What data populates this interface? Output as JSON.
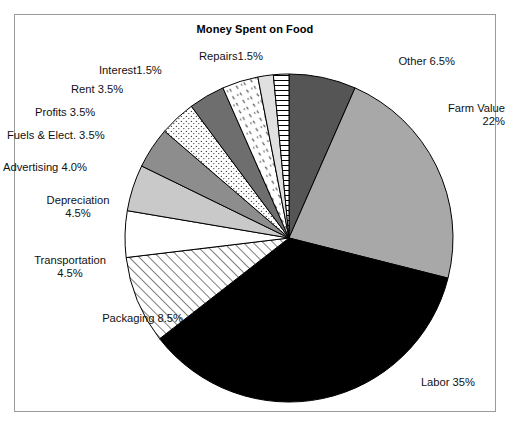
{
  "chart_data": {
    "type": "pie",
    "title": "Money Spent on Food",
    "xlabel": "",
    "ylabel": "",
    "legend_position": "none",
    "grid": false,
    "units": "percent",
    "total": 100,
    "categories": [
      "Other",
      "Farm Value",
      "Labor",
      "Packaging",
      "Transportation",
      "Depreciation",
      "Advertising",
      "Fuels & Elect.",
      "Profits",
      "Rent",
      "Interest",
      "Repairs"
    ],
    "values": [
      6.5,
      22,
      35,
      8.5,
      4.5,
      4.5,
      4.0,
      3.5,
      3.5,
      3.5,
      1.5,
      1.5
    ],
    "slices": [
      {
        "name": "Other",
        "value": 6.5,
        "label": "Other 6.5%",
        "fill": "#555555",
        "pattern": "solid"
      },
      {
        "name": "Farm Value",
        "value": 22,
        "label": "Farm Value\n22%",
        "fill": "#a8a8a8",
        "pattern": "solid"
      },
      {
        "name": "Labor",
        "value": 35,
        "label": "Labor 35%",
        "fill": "#000000",
        "pattern": "solid"
      },
      {
        "name": "Packaging",
        "value": 8.5,
        "label": "Packaging 8.5%",
        "fill": "#ffffff",
        "pattern": "diagonal-hatch"
      },
      {
        "name": "Transportation",
        "value": 4.5,
        "label": "Transportation\n4.5%",
        "fill": "#ffffff",
        "pattern": "solid"
      },
      {
        "name": "Depreciation",
        "value": 4.5,
        "label": "Depreciation\n4.5%",
        "fill": "#c9c9c9",
        "pattern": "solid"
      },
      {
        "name": "Advertising",
        "value": 4.0,
        "label": "Advertising 4.0%",
        "fill": "#8d8d8d",
        "pattern": "solid"
      },
      {
        "name": "Fuels & Elect.",
        "value": 3.5,
        "label": "Fuels & Elect. 3.5%",
        "fill": "#ffffff",
        "pattern": "dots"
      },
      {
        "name": "Profits",
        "value": 3.5,
        "label": "Profits 3.5%",
        "fill": "#6e6e6e",
        "pattern": "solid"
      },
      {
        "name": "Rent",
        "value": 3.5,
        "label": "Rent 3.5%",
        "fill": "#ffffff",
        "pattern": "dashes"
      },
      {
        "name": "Interest",
        "value": 1.5,
        "label": "Interest1.5%",
        "fill": "#e0e0e0",
        "pattern": "solid"
      },
      {
        "name": "Repairs",
        "value": 1.5,
        "label": "Repairs1.5%",
        "fill": "#ffffff",
        "pattern": "horizontal-lines"
      }
    ]
  },
  "labels": {
    "title": "Money Spent on Food",
    "repairs": "Repairs1.5%",
    "interest": "Interest1.5%",
    "rent": "Rent 3.5%",
    "profits": "Profits 3.5%",
    "fuels": "Fuels & Elect. 3.5%",
    "advertising": "Advertising 4.0%",
    "depreciation_l1": "Depreciation",
    "depreciation_l2": "4.5%",
    "transportation_l1": "Transportation",
    "transportation_l2": "4.5%",
    "packaging": "Packaging 8.5%",
    "labor": "Labor 35%",
    "farm_value_l1": "Farm Value",
    "farm_value_l2": "22%",
    "other": "Other 6.5%"
  },
  "colors": {
    "frame_border": "#9a9a9a",
    "background": "#ffffff",
    "text": "#111111",
    "outline": "#000000"
  }
}
